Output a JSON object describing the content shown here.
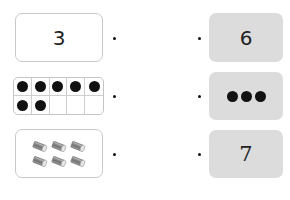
{
  "exercise": {
    "type": "match-quantities",
    "left_column": [
      {
        "kind": "numeral",
        "value": "3"
      },
      {
        "kind": "ten-frame",
        "filled": 7,
        "total": 10
      },
      {
        "kind": "picture",
        "object": "tin-can",
        "count": 6
      }
    ],
    "right_column": [
      {
        "kind": "numeral",
        "value": "6"
      },
      {
        "kind": "dots",
        "count": 3
      },
      {
        "kind": "numeral",
        "value": "7"
      }
    ]
  },
  "colors": {
    "left_box_border": "#c9c9c9",
    "right_box_fill": "#dcdcdc",
    "counter": "#111111"
  }
}
